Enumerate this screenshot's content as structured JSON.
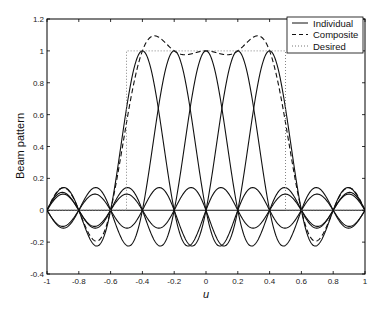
{
  "chart_data": {
    "type": "line",
    "title": "",
    "xlabel": "u",
    "ylabel": "Beam pattern",
    "xlim": [
      -1,
      1
    ],
    "ylim": [
      -0.4,
      1.2
    ],
    "xticks": [
      -1,
      -0.8,
      -0.6,
      -0.4,
      -0.2,
      0,
      0.2,
      0.4,
      0.6,
      0.8,
      1
    ],
    "xtick_labels": [
      "-1",
      "-0.8",
      "-0.6",
      "-0.4",
      "-0.2",
      "0",
      "0.2",
      "0.4",
      "0.6",
      "0.8",
      "1"
    ],
    "yticks": [
      -0.4,
      -0.2,
      0,
      0.2,
      0.4,
      0.6,
      0.8,
      1,
      1.2
    ],
    "ytick_labels": [
      "-0.4",
      "-0.2",
      "0",
      "0.2",
      "0.4",
      "0.6",
      "0.8",
      "1",
      "1.2"
    ],
    "grid": false,
    "legend_position": "upper right",
    "legend": [
      "Individual",
      "Composite",
      "Desired"
    ],
    "model": {
      "array_elements_N": 10,
      "individual_beam_centers": [
        -0.4,
        -0.2,
        0,
        0.2,
        0.4
      ],
      "desired_region": [
        -0.5,
        0.5
      ],
      "desired_level": 1
    },
    "x": [
      -1,
      -0.9,
      -0.8,
      -0.7,
      -0.6,
      -0.5,
      -0.4,
      -0.3,
      -0.2,
      -0.1,
      0,
      0.1,
      0.2,
      0.3,
      0.4,
      0.5,
      0.6,
      0.7,
      0.8,
      0.9,
      1
    ],
    "series": [
      {
        "name": "Individual (u0=-0.4)",
        "style": "solid",
        "values": [
          0,
          -0.101,
          0,
          0.112,
          0,
          -0.22,
          1,
          -0.22,
          0,
          0.141,
          0,
          -0.112,
          0,
          0.101,
          0,
          -0.101,
          0,
          0.112,
          0,
          -0.141,
          0
        ]
      },
      {
        "name": "Individual (u0=-0.2)",
        "style": "solid",
        "values": [
          0,
          0.112,
          0,
          -0.141,
          0,
          0.639,
          0,
          0.639,
          1,
          -0.22,
          0,
          0.141,
          0,
          -0.112,
          0,
          0.101,
          0,
          -0.101,
          0,
          0.112,
          0
        ]
      },
      {
        "name": "Individual (u0=0)",
        "style": "solid",
        "values": [
          0,
          0.101,
          0,
          -0.112,
          0,
          0.141,
          0,
          -0.22,
          0,
          0.639,
          1,
          0.639,
          0,
          -0.22,
          0,
          0.141,
          0,
          -0.112,
          0,
          0.101,
          0
        ]
      },
      {
        "name": "Individual (u0=0.2)",
        "style": "solid",
        "values": [
          0,
          0.112,
          0,
          -0.101,
          0,
          0.101,
          0,
          -0.112,
          0,
          0.141,
          0,
          -0.22,
          1,
          0.639,
          0,
          0.639,
          0,
          -0.141,
          0,
          0.112,
          0
        ]
      },
      {
        "name": "Individual (u0=0.4)",
        "style": "solid",
        "values": [
          0,
          -0.141,
          0,
          0.112,
          0,
          -0.101,
          0,
          0.101,
          0,
          -0.112,
          0,
          0.141,
          0,
          -0.22,
          1,
          0.639,
          0,
          -0.22,
          0,
          -0.101,
          0
        ]
      },
      {
        "name": "Composite",
        "style": "dashed",
        "values": [
          0,
          0.141,
          0,
          -0.191,
          0,
          0.549,
          1,
          1.087,
          1,
          0.979,
          1,
          0.979,
          1,
          1.087,
          1,
          0.549,
          0,
          -0.191,
          0,
          0.141,
          0
        ]
      },
      {
        "name": "Desired",
        "style": "dotted",
        "values": [
          0,
          0,
          0,
          0,
          0,
          1,
          1,
          1,
          1,
          1,
          1,
          1,
          1,
          1,
          1,
          1,
          0,
          0,
          0,
          0,
          0
        ]
      }
    ]
  },
  "legend": {
    "items": [
      {
        "label": "Individual",
        "style": "solid"
      },
      {
        "label": "Composite",
        "style": "dashed"
      },
      {
        "label": "Desired",
        "style": "dotted"
      }
    ]
  },
  "axes": {
    "xlabel": "u",
    "ylabel": "Beam pattern"
  },
  "colors": {
    "line": "#111111",
    "axis": "#000000",
    "desired": "#777777"
  }
}
